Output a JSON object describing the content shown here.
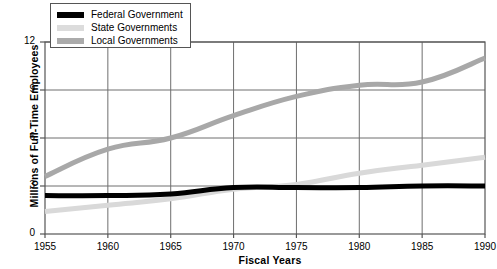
{
  "chart_data": {
    "type": "line",
    "title": "",
    "xlabel": "Fiscal Years",
    "ylabel": "Millions of Full-Time Employees",
    "x": [
      1955,
      1960,
      1965,
      1970,
      1975,
      1980,
      1985,
      1990
    ],
    "xlim": [
      1955,
      1990
    ],
    "ylim": [
      0,
      12
    ],
    "xticks": [
      "1955",
      "1960",
      "1965",
      "1970",
      "1975",
      "1980",
      "1985",
      "1990"
    ],
    "yticks": [
      "0",
      "3",
      "6",
      "9",
      "12"
    ],
    "grid": true,
    "legend_position": "top-left",
    "series": [
      {
        "name": "Federal Government",
        "color": "#000000",
        "values": [
          2.4,
          2.4,
          2.5,
          2.9,
          2.9,
          2.9,
          3.0,
          3.0
        ]
      },
      {
        "name": "State Governments",
        "color": "#d9d9d9",
        "values": [
          1.4,
          1.8,
          2.2,
          2.8,
          3.1,
          3.8,
          4.3,
          4.8
        ]
      },
      {
        "name": "Local Governments",
        "color": "#a8a8a8",
        "values": [
          3.6,
          5.3,
          6.0,
          7.4,
          8.6,
          9.3,
          9.5,
          11.0
        ]
      }
    ]
  },
  "legend": {
    "items": [
      {
        "label": "Federal Government",
        "color": "#000000"
      },
      {
        "label": "State Governments",
        "color": "#dcdcdc"
      },
      {
        "label": "Local Governments",
        "color": "#ababab"
      }
    ]
  },
  "axes": {
    "x_title": "Fiscal Years",
    "y_title": "Millions of Full-Time Employees"
  }
}
